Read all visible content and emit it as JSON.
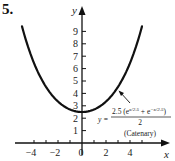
{
  "problem_number": "5.",
  "chart_data": {
    "type": "line",
    "title": "",
    "xlabel": "x",
    "ylabel": "y",
    "xlim": [
      -5,
      6
    ],
    "ylim": [
      0,
      10
    ],
    "x_ticks": [
      -4,
      -2,
      0,
      2,
      4
    ],
    "y_ticks": [
      1,
      2,
      3,
      4,
      5,
      6,
      7,
      8,
      9
    ],
    "grid": false,
    "series": [
      {
        "name": "Catenary",
        "equation": "y = 2.5(e^(x/2.5) + e^(-x/2.5))/2",
        "x": [
          -5,
          -4,
          -3,
          -2,
          -1,
          0,
          1,
          2,
          3,
          4,
          5
        ],
        "values": [
          9.4,
          6.44,
          4.53,
          3.34,
          2.7,
          2.5,
          2.7,
          3.34,
          4.53,
          6.44,
          9.4
        ]
      }
    ],
    "annotations": [
      {
        "text": "y = 2.5(e^(x/2.5) + e^(-x/2.5)) / 2",
        "target": "curve near x=3"
      },
      {
        "text": "(Catenary)"
      }
    ]
  },
  "labels": {
    "x_axis": "x",
    "y_axis": "y",
    "x_ticks": [
      "−4",
      "−2",
      "0",
      "2",
      "4"
    ],
    "y_ticks": [
      "1",
      "2",
      "3",
      "4",
      "5",
      "6",
      "7",
      "8",
      "9"
    ],
    "eq_lhs": "y =",
    "eq_num": "2.5 (e",
    "eq_exp1": "x/2.5",
    "eq_mid": " + e",
    "eq_exp2": "−x/2.5",
    "eq_close": ")",
    "eq_den": "2",
    "eq_name": "(Catenary)"
  }
}
